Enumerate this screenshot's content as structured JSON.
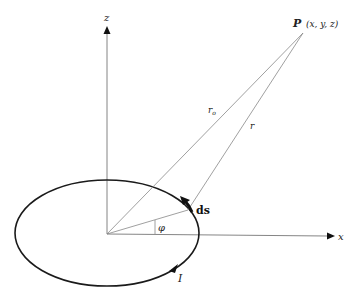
{
  "diagram": {
    "labels": {
      "z_axis": "z",
      "x_axis": "x",
      "point": "P",
      "point_coords": "(x, y, z)",
      "r_origin": "r",
      "r_origin_sub": "o",
      "r_element": "r",
      "line_element": "ds",
      "angle": "φ",
      "current": "I"
    },
    "colors": {
      "axis": "#777777",
      "loop": "#1a1a1a",
      "lines": "#888888",
      "text": "#222222"
    }
  }
}
